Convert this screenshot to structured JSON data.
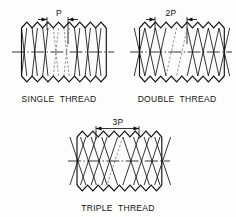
{
  "figure": {
    "background_color": "#fdfdfb",
    "line_color": "#111111",
    "hidden_line_color": "#666666"
  },
  "diagrams": [
    {
      "id": "single-thread",
      "caption": "SINGLE  THREAD",
      "dimension_label": "P",
      "starts": 1,
      "lead_in_pitches": 1,
      "teeth": 7,
      "pitch_px": 10.6,
      "body": {
        "x": 26,
        "y": 22,
        "width": 75,
        "height": 58
      },
      "dimension": {
        "from_tooth": 2,
        "to_tooth": 3
      }
    },
    {
      "id": "double-thread",
      "caption": "DOUBLE  THREAD",
      "dimension_label": "2P",
      "starts": 2,
      "lead_in_pitches": 2,
      "teeth": 7,
      "pitch_px": 10.6,
      "body": {
        "x": 134,
        "y": 22,
        "width": 75,
        "height": 58
      },
      "dimension": {
        "from_tooth": 1,
        "to_tooth": 3
      }
    },
    {
      "id": "triple-thread",
      "caption": "TRIPLE  THREAD",
      "dimension_label": "3P",
      "starts": 3,
      "lead_in_pitches": 3,
      "teeth": 7,
      "pitch_px": 10.6,
      "body": {
        "x": 77,
        "y": 131,
        "width": 82,
        "height": 58
      },
      "dimension": {
        "from_tooth": 1,
        "to_tooth": 4
      }
    }
  ]
}
